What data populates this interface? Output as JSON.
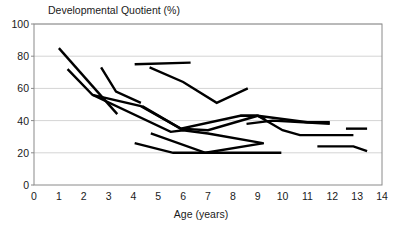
{
  "chart_data": {
    "type": "line",
    "title": "Developmental Quotient (%)",
    "xlabel": "Age (years)",
    "ylabel": "Developmental Quotient (%)",
    "xlim": [
      0,
      14
    ],
    "ylim": [
      0,
      100
    ],
    "xticks": [
      0,
      1,
      2,
      3,
      4,
      5,
      6,
      7,
      8,
      9,
      10,
      11,
      12,
      13,
      14
    ],
    "yticks": [
      0,
      20,
      40,
      60,
      80,
      100
    ],
    "grid": "horizontal",
    "legend": "none",
    "line_color": "#000000",
    "series": [
      {
        "name": "subject-1",
        "x": [
          1.0,
          3.35
        ],
        "values": [
          85,
          44
        ]
      },
      {
        "name": "subject-2",
        "x": [
          1.35,
          2.35,
          5.5,
          6.0,
          7.0,
          9.2
        ],
        "values": [
          72,
          56,
          33,
          34,
          32,
          26
        ]
      },
      {
        "name": "subject-3",
        "x": [
          2.7,
          3.3,
          4.3
        ],
        "values": [
          73,
          58,
          51
        ]
      },
      {
        "name": "subject-4",
        "x": [
          2.35,
          4.3,
          5.9,
          7.0,
          9.0
        ],
        "values": [
          56,
          49,
          35,
          34,
          43
        ]
      },
      {
        "name": "subject-5",
        "x": [
          4.05,
          6.3
        ],
        "values": [
          75,
          76
        ]
      },
      {
        "name": "subject-6",
        "x": [
          4.65,
          6.0,
          7.35,
          8.6
        ],
        "values": [
          73,
          64,
          51,
          60
        ]
      },
      {
        "name": "subject-7",
        "x": [
          4.35,
          5.9,
          8.3,
          9.0,
          9.3
        ],
        "values": [
          49,
          35,
          43,
          43,
          41
        ]
      },
      {
        "name": "subject-8",
        "x": [
          4.05,
          5.6,
          9.95
        ],
        "values": [
          26,
          20,
          20
        ]
      },
      {
        "name": "subject-9",
        "x": [
          4.7,
          6.9,
          9.25
        ],
        "values": [
          32,
          20,
          26
        ]
      },
      {
        "name": "subject-10",
        "x": [
          8.3,
          9.0,
          10.0,
          10.7,
          12.85
        ],
        "values": [
          43,
          43,
          34,
          31,
          31
        ]
      },
      {
        "name": "subject-11",
        "x": [
          8.55,
          9.6,
          11.9
        ],
        "values": [
          38,
          40,
          38
        ]
      },
      {
        "name": "subject-12",
        "x": [
          9.0,
          11.0,
          11.9
        ],
        "values": [
          43,
          39,
          39
        ]
      },
      {
        "name": "subject-13",
        "x": [
          11.4,
          12.85,
          13.4
        ],
        "values": [
          24,
          24,
          21
        ]
      },
      {
        "name": "subject-14",
        "x": [
          12.55,
          13.4
        ],
        "values": [
          35,
          35
        ]
      }
    ]
  },
  "axes": {
    "plot_left_px": 34,
    "plot_right_px": 382,
    "plot_top_px": 24,
    "plot_bottom_px": 185
  }
}
